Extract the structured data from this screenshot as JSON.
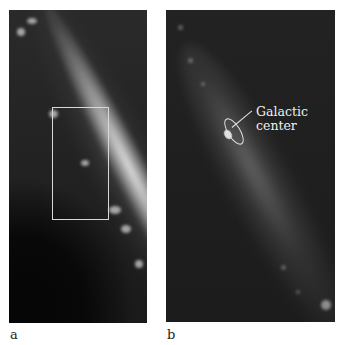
{
  "figure": {
    "panels": [
      {
        "id": "a",
        "label": "a",
        "description": "Wide-field infrared view of Milky Way galactic plane running diagonally, with inset rectangle marking zoomed region"
      },
      {
        "id": "b",
        "label": "b",
        "description": "Zoomed view of region containing the galactic center, with contour outline",
        "annotation": {
          "line1": "Galactic",
          "line2": "center"
        }
      }
    ],
    "colors": {
      "background": "#ffffff",
      "panel_dark": "#1f1f1f",
      "band_light": "#e8e8e8",
      "annotation_text": "#f0f0f0",
      "inset_box": "#d8d8d8"
    }
  }
}
